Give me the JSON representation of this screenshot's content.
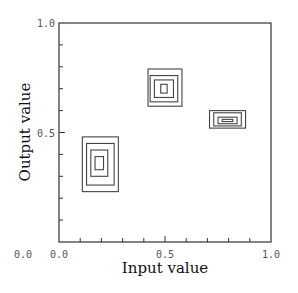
{
  "chart_data": {
    "type": "contour",
    "title": "",
    "xlabel": "Input value",
    "ylabel": "Output value",
    "xlim": [
      0.0,
      1.0
    ],
    "ylim": [
      0.0,
      1.0
    ],
    "x_tick_labels": [
      {
        "value": 0.0,
        "label": "0.0"
      },
      {
        "value": 0.5,
        "label": "0.5"
      },
      {
        "value": 1.0,
        "label": "1.0"
      }
    ],
    "y_tick_labels": [
      {
        "value": 0.0,
        "label": "0.0"
      },
      {
        "value": 0.5,
        "label": "0.5"
      },
      {
        "value": 1.0,
        "label": "1.0"
      }
    ],
    "minor_tick_step": 0.1,
    "grid": false,
    "legend": null,
    "clusters": [
      {
        "name": "cluster-lower-left",
        "center": [
          0.19,
          0.36
        ],
        "rects": [
          {
            "x0": 0.11,
            "x1": 0.28,
            "y0": 0.23,
            "y1": 0.48
          },
          {
            "x0": 0.13,
            "x1": 0.26,
            "y0": 0.26,
            "y1": 0.45
          },
          {
            "x0": 0.15,
            "x1": 0.23,
            "y0": 0.3,
            "y1": 0.42
          },
          {
            "x0": 0.17,
            "x1": 0.21,
            "y0": 0.33,
            "y1": 0.39
          }
        ]
      },
      {
        "name": "cluster-middle",
        "center": [
          0.5,
          0.7
        ],
        "rects": [
          {
            "x0": 0.42,
            "x1": 0.58,
            "y0": 0.62,
            "y1": 0.79
          },
          {
            "x0": 0.43,
            "x1": 0.56,
            "y0": 0.64,
            "y1": 0.76
          },
          {
            "x0": 0.45,
            "x1": 0.54,
            "y0": 0.66,
            "y1": 0.74
          },
          {
            "x0": 0.48,
            "x1": 0.51,
            "y0": 0.68,
            "y1": 0.72
          }
        ]
      },
      {
        "name": "cluster-right",
        "center": [
          0.8,
          0.56
        ],
        "rects": [
          {
            "x0": 0.71,
            "x1": 0.88,
            "y0": 0.52,
            "y1": 0.6
          },
          {
            "x0": 0.73,
            "x1": 0.86,
            "y0": 0.53,
            "y1": 0.59
          },
          {
            "x0": 0.75,
            "x1": 0.84,
            "y0": 0.54,
            "y1": 0.57
          },
          {
            "x0": 0.77,
            "x1": 0.82,
            "y0": 0.55,
            "y1": 0.56
          }
        ]
      }
    ]
  }
}
